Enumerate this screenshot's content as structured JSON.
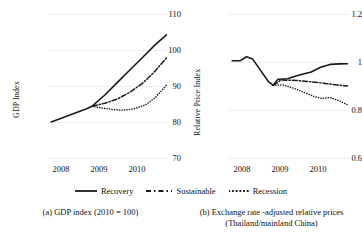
{
  "chart_data": [
    {
      "type": "line",
      "panel": "a",
      "title": "",
      "caption": "(a) GDP index (2010 = 100)",
      "xlabel": "",
      "ylabel": "GDP Index",
      "ylim": [
        70,
        110
      ],
      "yticks": [
        110,
        100,
        90,
        80,
        70
      ],
      "xticks": [
        "2008",
        "2009",
        "2010"
      ],
      "xlim": [
        2007.6,
        2011.4
      ],
      "grid": true,
      "legend_position": "bottom-center",
      "series": [
        {
          "name": "Recovery",
          "style": "solid",
          "x": [
            2007.7,
            2008.0,
            2008.4,
            2008.8,
            2009.0,
            2009.4,
            2009.8,
            2010.2,
            2010.6,
            2011.0,
            2011.35
          ],
          "values": [
            80.0,
            81.0,
            82.3,
            83.6,
            84.4,
            87.5,
            91.0,
            94.5,
            98.0,
            101.5,
            104.2
          ]
        },
        {
          "name": "Sustainable",
          "style": "dash-dot",
          "x": [
            2009.0,
            2009.4,
            2009.8,
            2010.2,
            2010.6,
            2011.0,
            2011.35
          ],
          "values": [
            84.4,
            85.2,
            86.4,
            88.3,
            90.8,
            94.2,
            97.8
          ]
        },
        {
          "name": "Recession",
          "style": "dotted",
          "x": [
            2009.0,
            2009.3,
            2009.7,
            2010.0,
            2010.3,
            2010.7,
            2011.0,
            2011.35
          ],
          "values": [
            84.4,
            83.9,
            83.4,
            83.3,
            83.6,
            84.8,
            86.8,
            90.2
          ]
        }
      ]
    },
    {
      "type": "line",
      "panel": "b",
      "title": "",
      "caption": "(b) Exchange rate -adjusted relative prices",
      "caption_line2": "(Thailand/mainland China)",
      "xlabel": "",
      "ylabel": "Relative Price Index",
      "ylim": [
        0.6,
        1.2
      ],
      "yticks": [
        "1.2",
        "1",
        "0.8",
        "0.6"
      ],
      "xticks": [
        "2008",
        "2009",
        "2010"
      ],
      "xlim": [
        2007.6,
        2011.4
      ],
      "grid": true,
      "legend_position": "bottom-center",
      "series": [
        {
          "name": "Recovery",
          "style": "solid",
          "x": [
            2007.7,
            2007.95,
            2008.15,
            2008.35,
            2008.6,
            2008.85,
            2009.0,
            2009.15,
            2009.45,
            2009.8,
            2010.2,
            2010.5,
            2010.8,
            2011.1,
            2011.35
          ],
          "values": [
            1.005,
            1.005,
            1.022,
            1.012,
            0.965,
            0.918,
            0.903,
            0.928,
            0.93,
            0.945,
            0.958,
            0.978,
            0.99,
            0.992,
            0.993
          ]
        },
        {
          "name": "Sustainable",
          "style": "dash-dot",
          "x": [
            2009.0,
            2009.25,
            2009.6,
            2010.0,
            2010.4,
            2010.8,
            2011.1,
            2011.35
          ],
          "values": [
            0.903,
            0.925,
            0.924,
            0.92,
            0.915,
            0.908,
            0.903,
            0.9
          ]
        },
        {
          "name": "Recession",
          "style": "dotted",
          "x": [
            2009.0,
            2009.3,
            2009.7,
            2010.0,
            2010.3,
            2010.55,
            2010.8,
            2011.1,
            2011.35
          ],
          "values": [
            0.903,
            0.905,
            0.888,
            0.872,
            0.856,
            0.848,
            0.852,
            0.838,
            0.822
          ]
        }
      ]
    }
  ],
  "legend": {
    "items": [
      {
        "label": "Recovery",
        "style": "solid"
      },
      {
        "label": "Sustainable",
        "style": "dash-dot"
      },
      {
        "label": "Recession",
        "style": "dotted"
      }
    ]
  },
  "colors": {
    "line": "#1a1a1a",
    "grid": "#eeeeee",
    "text": "#111111",
    "background": "#ffffff"
  }
}
